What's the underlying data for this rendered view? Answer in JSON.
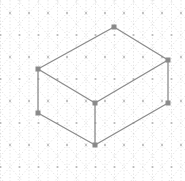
{
  "canvas": {
    "width": 185,
    "height": 181,
    "background_color": "#ffffff",
    "description": "Isometric dotted grid paper with a 3D rectangular box (cuboid) drawn on it"
  },
  "grid": {
    "name": "isometric-dot-grid",
    "line_color": "#cfcfcf",
    "dot_color": "#b8b8b8",
    "line_style": "dotted",
    "line_width": 0.6,
    "dot_radius": 1.1,
    "column_spacing": 19,
    "row_spacing": 22,
    "origin_x": 10,
    "origin_y": 13,
    "columns": 10,
    "rows": 8,
    "axis_angles_deg": [
      90,
      30,
      150
    ]
  },
  "shape": {
    "name": "isometric-cuboid",
    "edge_color": "#8c8c8c",
    "edge_width": 1.3,
    "vertex_marker_color": "#8a8a8a",
    "vertex_marker_size": 5,
    "fill": "none",
    "vertices": [
      {
        "id": "top-back",
        "label": "Top Back",
        "x": 114,
        "y": 27
      },
      {
        "id": "top-left",
        "label": "Top Left",
        "x": 38,
        "y": 69
      },
      {
        "id": "top-right",
        "label": "Top Right",
        "x": 168,
        "y": 60
      },
      {
        "id": "top-front",
        "label": "Top Front",
        "x": 95,
        "y": 103
      },
      {
        "id": "bottom-left",
        "label": "Bottom Left",
        "x": 38,
        "y": 113
      },
      {
        "id": "bottom-right",
        "label": "Bottom Right",
        "x": 168,
        "y": 103
      },
      {
        "id": "bottom-front",
        "label": "Bottom Front",
        "x": 95,
        "y": 145
      }
    ],
    "edges": [
      {
        "id": "top-back-to-top-left",
        "from": "top-back",
        "to": "top-left"
      },
      {
        "id": "top-back-to-top-right",
        "from": "top-back",
        "to": "top-right"
      },
      {
        "id": "top-left-to-top-front",
        "from": "top-left",
        "to": "top-front"
      },
      {
        "id": "top-right-to-top-front",
        "from": "top-right",
        "to": "top-front"
      },
      {
        "id": "top-left-to-bottom-left",
        "from": "top-left",
        "to": "bottom-left"
      },
      {
        "id": "top-right-to-bottom-right",
        "from": "top-right",
        "to": "bottom-right"
      },
      {
        "id": "top-front-to-bottom-front",
        "from": "top-front",
        "to": "bottom-front"
      },
      {
        "id": "bottom-left-to-bottom-front",
        "from": "bottom-left",
        "to": "bottom-front"
      },
      {
        "id": "bottom-right-to-bottom-front",
        "from": "bottom-right",
        "to": "bottom-front"
      }
    ]
  }
}
